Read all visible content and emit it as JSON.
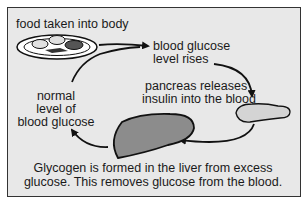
{
  "diagram": {
    "labels": {
      "food": "food taken into body",
      "glucose_rises_1": "blood glucose",
      "glucose_rises_2": "level rises",
      "pancreas_1": "pancreas releases",
      "pancreas_2": "insulin into the blood",
      "normal_1": "normal",
      "normal_2": "level of",
      "normal_3": "blood glucose"
    },
    "caption": {
      "line1": "Glycogen is formed in the liver from excess",
      "line2": "glucose. This removes glucose from the blood."
    },
    "icons": [
      "plate-of-food-icon",
      "pancreas-icon",
      "liver-icon"
    ],
    "colors": {
      "panel_bg": "#e8e8e8",
      "liver_fill": "#8c8c8c",
      "pancreas_fill": "#d4d4d4",
      "line": "#111111"
    }
  }
}
